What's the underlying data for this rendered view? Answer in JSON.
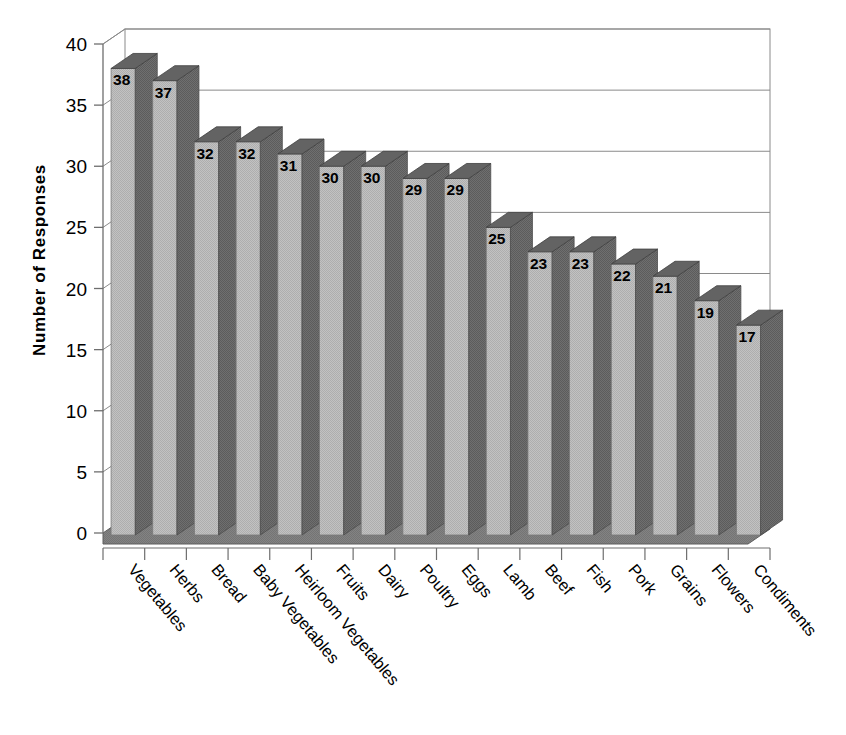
{
  "chart_data": {
    "type": "bar",
    "title": "",
    "subtitle": "",
    "xlabel": "",
    "ylabel": "Number of Responses",
    "ylim": [
      0,
      40
    ],
    "ytick_step": 5,
    "yticks": [
      "0",
      "5",
      "10",
      "15",
      "20",
      "25",
      "30",
      "35",
      "40"
    ],
    "grid": true,
    "legend": "none",
    "style": "3d-column",
    "categories": [
      "Vegetables",
      "Herbs",
      "Bread",
      "Baby Vegetables",
      "Heirloom Vegetables",
      "Fruits",
      "Dairy",
      "Poultry",
      "Eggs",
      "Lamb",
      "Beef",
      "Fish",
      "Pork",
      "Grains",
      "Flowers",
      "Condiments"
    ],
    "values": [
      38,
      37,
      32,
      32,
      31,
      30,
      30,
      29,
      29,
      25,
      23,
      23,
      22,
      21,
      19,
      17
    ],
    "data_labels": [
      "38",
      "37",
      "32",
      "32",
      "31",
      "30",
      "30",
      "29",
      "29",
      "25",
      "23",
      "23",
      "22",
      "21",
      "19",
      "17"
    ],
    "colors": {
      "bar_front": "#b9b9b9",
      "bar_side": "#6b6b6b",
      "bar_top": "#5f5f5f",
      "floor": "#7d7d7d",
      "gridline": "#8a8a8a",
      "axis": "#6e6e6e",
      "background": "#ffffff",
      "text": "#000000"
    }
  }
}
